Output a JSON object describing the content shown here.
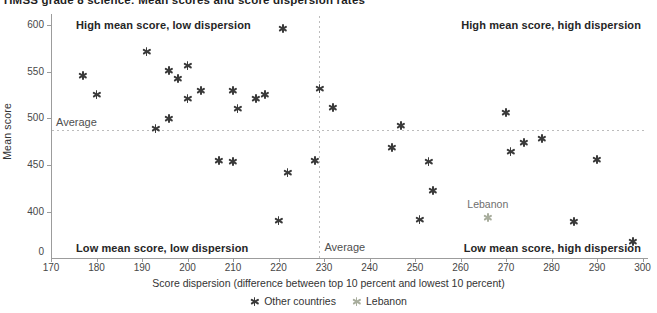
{
  "chart_data": {
    "type": "scatter",
    "title": "TIMSS grade 8 science: Mean scores and score dispersion rates",
    "xlabel": "Score dispersion (difference between top 10 percent and lowest 10 percent)",
    "ylabel": "Mean score",
    "xlim": [
      170,
      300
    ],
    "x_ticks": [
      170,
      180,
      190,
      200,
      210,
      220,
      230,
      240,
      250,
      260,
      270,
      280,
      290,
      300
    ],
    "y_ticks": [
      600,
      550,
      500,
      450,
      400
    ],
    "y_origin_label": "0",
    "grid": "off",
    "legend_position": "bottom-center",
    "average_label": "Average",
    "average_x": 229,
    "average_y": 488,
    "quadrant_labels": {
      "top_left": "High mean score, low dispersion",
      "top_right": "High mean score, high dispersion",
      "bottom_left": "Low mean score, low dispersion",
      "bottom_right": "Low mean score, high dispersion"
    },
    "annotation": {
      "text": "Lebanon",
      "x": 266,
      "y": 394
    },
    "series": [
      {
        "name": "Other countries",
        "color": "#3a3a3a",
        "points": [
          [
            177,
            546
          ],
          [
            180,
            526
          ],
          [
            191,
            572
          ],
          [
            193,
            489
          ],
          [
            196,
            551
          ],
          [
            196,
            500
          ],
          [
            198,
            543
          ],
          [
            200,
            557
          ],
          [
            200,
            521
          ],
          [
            203,
            530
          ],
          [
            207,
            455
          ],
          [
            210,
            530
          ],
          [
            210,
            454
          ],
          [
            211,
            511
          ],
          [
            215,
            521
          ],
          [
            217,
            526
          ],
          [
            220,
            391
          ],
          [
            221,
            596
          ],
          [
            222,
            442
          ],
          [
            228,
            455
          ],
          [
            229,
            532
          ],
          [
            232,
            512
          ],
          [
            245,
            469
          ],
          [
            247,
            492
          ],
          [
            251,
            392
          ],
          [
            253,
            454
          ],
          [
            254,
            423
          ],
          [
            270,
            506
          ],
          [
            271,
            464
          ],
          [
            274,
            474
          ],
          [
            278,
            478
          ],
          [
            285,
            390
          ],
          [
            290,
            456
          ],
          [
            298,
            368
          ]
        ]
      },
      {
        "name": "Lebanon",
        "color": "#a8ad9d",
        "points": [
          [
            266,
            394
          ]
        ]
      }
    ],
    "colors": {
      "axis": "#9c9c9c",
      "dashed_line": "#bcbcbc",
      "marker_other": "#3a3a3a",
      "marker_lebanon": "#a8ad9d"
    }
  }
}
